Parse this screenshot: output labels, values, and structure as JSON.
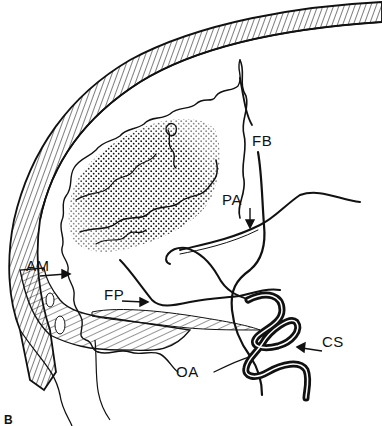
{
  "figure": {
    "panel_label": "B",
    "labels": {
      "fb": "FB",
      "pa": "PA",
      "am": "AM",
      "fp": "FP",
      "oa": "OA",
      "cs": "CS"
    },
    "colors": {
      "ink": "#111111",
      "background": "#ffffff"
    }
  }
}
